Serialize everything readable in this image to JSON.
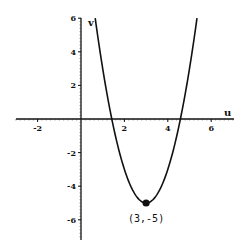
{
  "chart_data": {
    "type": "line",
    "title": "",
    "xlabel": "u",
    "ylabel": "v",
    "xlim": [
      -3,
      7
    ],
    "ylim": [
      -7,
      6
    ],
    "grid": false,
    "function": "v = 2(u - 3)^2 - 5",
    "x_ticks": [
      -2,
      2,
      4,
      6
    ],
    "x_tick_labels": [
      "-2",
      "2",
      "4",
      "6"
    ],
    "y_ticks": [
      6,
      4,
      2,
      -2,
      -4,
      -6
    ],
    "y_tick_labels": [
      "6",
      "4",
      "2",
      "-2",
      "-4",
      "-6"
    ],
    "series": [
      {
        "name": "parabola",
        "x": [
          0.655,
          1.0,
          1.5,
          2.0,
          2.5,
          3.0,
          3.5,
          4.0,
          4.5,
          5.0,
          5.345
        ],
        "y": [
          6.0,
          3.0,
          -0.5,
          -3.0,
          -4.5,
          -5.0,
          -4.5,
          -3.0,
          -0.5,
          3.0,
          6.0
        ]
      }
    ],
    "annotations": [
      {
        "text": "(3,-5)",
        "x": 3,
        "y": -5,
        "marker": "filled-circle"
      }
    ],
    "legend": "none"
  }
}
